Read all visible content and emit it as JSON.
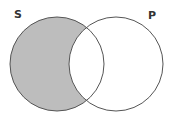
{
  "diagram": {
    "type": "venn",
    "sets": [
      {
        "id": "S",
        "label": "S",
        "cx": 57,
        "cy": 64,
        "r": 47
      },
      {
        "id": "P",
        "label": "P",
        "cx": 116,
        "cy": 64,
        "r": 47
      }
    ],
    "shaded_region": "S only (S minus P)",
    "colors": {
      "shade": "#bdbdbd",
      "stroke": "#555555",
      "background": "#ffffff",
      "label": "#333333"
    }
  }
}
